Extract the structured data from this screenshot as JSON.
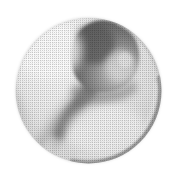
{
  "figure": {
    "alt_text": "Light gray circular disc containing a dark rounded bulb at upper center tapering into a narrow neck sweeping toward the lower left",
    "media": "scanned halftone print",
    "background_color": "#ffffff",
    "canvas": {
      "width": 176,
      "height": 178
    }
  },
  "disc": {
    "name": "outer-sphere",
    "center_x": 88.5,
    "center_y": 90.5,
    "radius": 73,
    "fill_light": "#f2f2f2",
    "fill_mid": "#e0e0e0",
    "fill_shadow": "#c8c8c8",
    "rim_color": "#8f8f8f"
  },
  "bulb": {
    "name": "teardrop-head",
    "center_x": 104,
    "center_y": 56,
    "radius_x": 32,
    "radius_y": 30,
    "dark_color": "#6e6e6e",
    "core_color": "#5a5a5a",
    "highlight_color": "#d6d6d6"
  },
  "neck": {
    "name": "tapering-neck",
    "start_x": 96,
    "start_y": 80,
    "end_x": 52,
    "end_y": 150,
    "color": "#8a8a8a"
  },
  "rim_shadow": {
    "name": "lower-right-rim",
    "color": "#9a9a9a",
    "thickness": 5
  },
  "tone_scale": {
    "white": "#ffffff",
    "lightest": "#f4f4f4",
    "light": "#e6e6e6",
    "mid_light": "#cccccc",
    "mid": "#a8a8a8",
    "mid_dark": "#888888",
    "dark": "#6b6b6b",
    "darkest": "#555555"
  }
}
